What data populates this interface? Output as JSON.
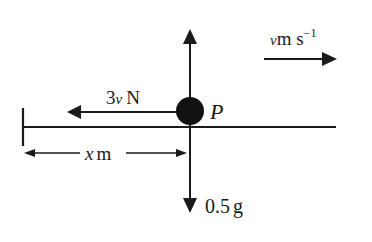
{
  "diagram": {
    "particle_label": "P",
    "forces": {
      "weight": {
        "value": "0.5",
        "unit": "g"
      },
      "resistance": {
        "coef": "3",
        "var": "v",
        "unit": "N"
      }
    },
    "velocity": {
      "var": "v",
      "unit": "m s",
      "exp": "−1"
    },
    "displacement": {
      "var": "x",
      "unit": "m"
    },
    "colors": {
      "ink": "#1a1a1a",
      "background": "#ffffff"
    }
  }
}
